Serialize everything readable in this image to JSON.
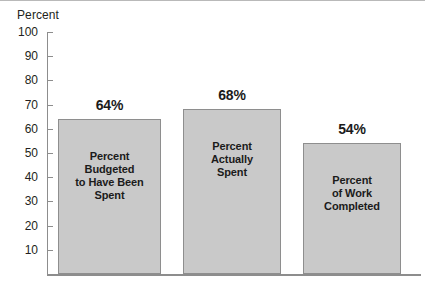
{
  "chart_data": {
    "type": "bar",
    "title": "",
    "subtitle": "",
    "xlabel": "",
    "ylabel": "Percent",
    "ylim": [
      0,
      100
    ],
    "grid": false,
    "legend": null,
    "ytick_labels": [
      "100",
      "90",
      "80",
      "70",
      "60",
      "50",
      "40",
      "30",
      "20",
      "10"
    ],
    "ytick_values": [
      100,
      90,
      80,
      70,
      60,
      50,
      40,
      30,
      20,
      10
    ],
    "categories": [
      "Percent Budgeted to Have Been Spent",
      "Percent Actually Spent",
      "Percent of Work Completed"
    ],
    "values": [
      64,
      68,
      54
    ],
    "value_labels": [
      "64%",
      "68%",
      "54%"
    ],
    "bars": [
      {
        "value": 64,
        "value_label": "64%",
        "label_lines": [
          "Percent",
          "Budgeted",
          "to Have Been",
          "Spent"
        ]
      },
      {
        "value": 68,
        "value_label": "68%",
        "label_lines": [
          "Percent",
          "Actually",
          "Spent"
        ]
      },
      {
        "value": 54,
        "value_label": "54%",
        "label_lines": [
          "Percent",
          "of Work",
          "Completed"
        ]
      }
    ],
    "colors": {
      "bar_fill": "#c9c9c9",
      "bar_stroke": "#8e8e8e",
      "axis": "#8d8d8d",
      "text": "#231f20",
      "background": "#ffffff"
    }
  }
}
